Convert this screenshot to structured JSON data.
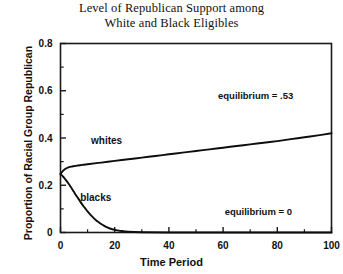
{
  "chart_data": {
    "type": "line",
    "title": "Level of Republican Support among White and Black Eligibles",
    "title_line1": "Level of Republican Support among",
    "title_line2": "White and Black Eligibles",
    "xlabel": "Time Period",
    "ylabel": "Proportion of Racial Group Republican",
    "xlim": [
      0,
      100
    ],
    "ylim": [
      0,
      0.8
    ],
    "xticks": [
      0,
      20,
      40,
      60,
      80,
      100
    ],
    "xtick_labels": [
      "0",
      "20",
      "40",
      "60",
      "80",
      "100"
    ],
    "yticks": [
      0,
      0.2,
      0.4,
      0.6,
      0.8
    ],
    "ytick_labels": [
      "0",
      "0.2",
      "0.4",
      "0.6",
      "0.8"
    ],
    "minor_xticks": [
      10,
      30,
      50,
      70,
      90
    ],
    "minor_yticks": [
      0.1,
      0.3,
      0.5,
      0.7
    ],
    "grid": false,
    "legend": "inline-annotations",
    "line_color": "#0d0d0d",
    "series": [
      {
        "name": "whites",
        "label": "whites",
        "equilibrium": 0.53,
        "x": [
          0,
          1,
          2,
          3,
          4,
          5,
          6,
          8,
          10,
          15,
          20,
          25,
          30,
          35,
          40,
          45,
          50,
          55,
          60,
          65,
          70,
          75,
          80,
          85,
          90,
          95,
          100
        ],
        "values": [
          0.248,
          0.262,
          0.271,
          0.276,
          0.279,
          0.281,
          0.283,
          0.286,
          0.289,
          0.296,
          0.303,
          0.31,
          0.317,
          0.324,
          0.331,
          0.338,
          0.345,
          0.352,
          0.359,
          0.366,
          0.373,
          0.38,
          0.387,
          0.395,
          0.403,
          0.411,
          0.42
        ]
      },
      {
        "name": "blacks",
        "label": "blacks",
        "equilibrium": 0,
        "x": [
          0,
          1,
          2,
          3,
          4,
          5,
          6,
          7,
          8,
          9,
          10,
          11,
          12,
          13,
          14,
          15,
          16,
          17,
          18,
          19,
          20,
          22,
          25,
          30,
          40,
          60,
          80,
          100
        ],
        "values": [
          0.248,
          0.236,
          0.222,
          0.206,
          0.189,
          0.171,
          0.153,
          0.136,
          0.119,
          0.104,
          0.089,
          0.076,
          0.064,
          0.053,
          0.044,
          0.036,
          0.029,
          0.023,
          0.018,
          0.014,
          0.011,
          0.007,
          0.003,
          0.001,
          0.0,
          0.0,
          0.0,
          0.0
        ]
      }
    ],
    "annotations": [
      {
        "name": "equilibrium-whites",
        "text": "equilibrium = .53",
        "x": 72,
        "y": 0.565
      },
      {
        "name": "equilibrium-blacks",
        "text": "equilibrium = 0",
        "x": 73,
        "y": 0.075
      },
      {
        "name": "series-label-whites",
        "text": "whites",
        "x": 17,
        "y": 0.375
      },
      {
        "name": "series-label-blacks",
        "text": "blacks",
        "x": 13,
        "y": 0.135
      }
    ]
  }
}
